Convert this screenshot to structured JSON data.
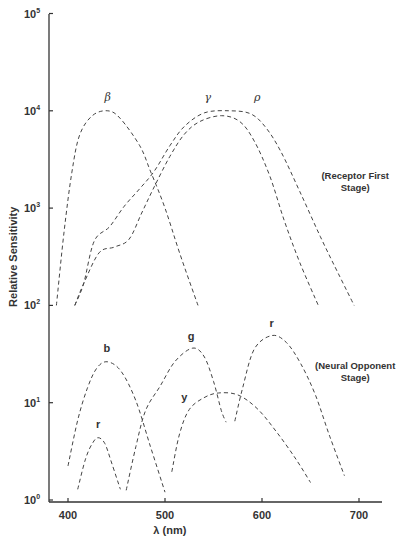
{
  "chart_data": {
    "type": "line",
    "title": "",
    "xlabel": "λ (nm)",
    "ylabel": "Relative Sensitivity",
    "xlim": [
      380,
      725
    ],
    "ylim_log10": [
      0,
      5
    ],
    "yscale": "log",
    "grid": false,
    "x_ticks": [
      400,
      500,
      600,
      700
    ],
    "y_ticks": [
      {
        "exp": 0,
        "label": "10",
        "sup": "0"
      },
      {
        "exp": 1,
        "label": "10",
        "sup": "1"
      },
      {
        "exp": 2,
        "label": "10",
        "sup": "2"
      },
      {
        "exp": 3,
        "label": "10",
        "sup": "3"
      },
      {
        "exp": 4,
        "label": "10",
        "sup": "4"
      },
      {
        "exp": 5,
        "label": "10",
        "sup": "5"
      }
    ],
    "annotations": [
      {
        "lines": [
          "(Receptor First",
          "Stage)"
        ],
        "x": 660,
        "y_log10": 3.3
      },
      {
        "lines": [
          "(Neural Opponent",
          "Stage)"
        ],
        "x": 660,
        "y_log10": 1.35
      }
    ],
    "series": [
      {
        "name": "β",
        "style": "greek",
        "group": "Receptor First Stage",
        "label_at": {
          "x": 441,
          "y_log10": 4.1
        },
        "x": [
          388,
          396,
          404,
          412,
          425,
          441,
          454,
          474,
          485,
          500,
          515,
          534
        ],
        "y_log10": [
          2.0,
          2.76,
          3.37,
          3.75,
          3.95,
          4.0,
          3.92,
          3.64,
          3.38,
          3.0,
          2.54,
          2.0
        ]
      },
      {
        "name": "γ",
        "style": "greek",
        "group": "Receptor First Stage",
        "label_at": {
          "x": 544,
          "y_log10": 4.1
        },
        "x": [
          407,
          416,
          432,
          448,
          463,
          476,
          489,
          505,
          520,
          536,
          558,
          577,
          592,
          608,
          623,
          639,
          658
        ],
        "y_log10": [
          2.0,
          2.22,
          2.54,
          2.6,
          2.68,
          2.95,
          3.22,
          3.53,
          3.76,
          3.89,
          3.95,
          3.89,
          3.69,
          3.33,
          2.87,
          2.44,
          2.0
        ]
      },
      {
        "name": "ρ",
        "style": "greek",
        "group": "Receptor First Stage",
        "label_at": {
          "x": 595,
          "y_log10": 4.1
        },
        "x": [
          407,
          416,
          427,
          443,
          458,
          474,
          489,
          505,
          520,
          541,
          567,
          588,
          603,
          619,
          639,
          660,
          680,
          695
        ],
        "y_log10": [
          2.0,
          2.22,
          2.66,
          2.81,
          3.02,
          3.2,
          3.38,
          3.64,
          3.84,
          3.98,
          4.0,
          3.97,
          3.84,
          3.59,
          3.17,
          2.71,
          2.3,
          2.0
        ]
      },
      {
        "name": "b",
        "style": "bold",
        "group": "Neural Opponent Stage",
        "label_at": {
          "x": 440,
          "y_log10": 1.52
        },
        "x": [
          400,
          410,
          420,
          430,
          441,
          455,
          470,
          485,
          500
        ],
        "y_log10": [
          0.35,
          0.82,
          1.15,
          1.36,
          1.42,
          1.32,
          1.02,
          0.55,
          0.08
        ]
      },
      {
        "name": "r",
        "style": "bold",
        "group": "Neural Opponent Stage",
        "label_at": {
          "x": 431,
          "y_log10": 0.74
        },
        "x": [
          410,
          418,
          425,
          431,
          438,
          445,
          454
        ],
        "y_log10": [
          0.11,
          0.42,
          0.58,
          0.64,
          0.58,
          0.38,
          0.11
        ]
      },
      {
        "name": "g",
        "style": "bold",
        "group": "Neural Opponent Stage",
        "label_at": {
          "x": 527,
          "y_log10": 1.64
        },
        "x": [
          460,
          470,
          480,
          495,
          510,
          528,
          540,
          550,
          558,
          563
        ],
        "y_log10": [
          0.1,
          0.55,
          0.92,
          1.17,
          1.42,
          1.56,
          1.48,
          1.22,
          0.92,
          0.8
        ]
      },
      {
        "name": "y",
        "style": "bold",
        "group": "Neural Opponent Stage",
        "label_at": {
          "x": 520,
          "y_log10": 1.02
        },
        "x": [
          507,
          515,
          525,
          540,
          555,
          575,
          595,
          615,
          635,
          650
        ],
        "y_log10": [
          0.29,
          0.68,
          0.93,
          1.05,
          1.1,
          1.08,
          0.94,
          0.7,
          0.42,
          0.18
        ]
      },
      {
        "name": "r",
        "style": "bold",
        "group": "Neural Opponent Stage",
        "label_at": {
          "x": 610,
          "y_log10": 1.78
        },
        "x": [
          572,
          580,
          592,
          610,
          625,
          640,
          655,
          670,
          685
        ],
        "y_log10": [
          0.81,
          1.15,
          1.55,
          1.69,
          1.62,
          1.4,
          1.08,
          0.65,
          0.25
        ]
      }
    ]
  }
}
